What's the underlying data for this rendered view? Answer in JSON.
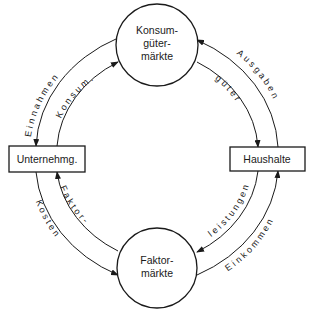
{
  "diagram": {
    "type": "circular-flow",
    "nodes": {
      "consumer_goods_market": {
        "lines": [
          "Konsum-",
          "güter-",
          "märkte"
        ]
      },
      "factor_market": {
        "lines": [
          "Faktor-",
          "märkte"
        ]
      },
      "firms": {
        "label": "Unternehmg."
      },
      "households": {
        "label": "Haushalte"
      }
    },
    "flows": {
      "revenue": {
        "label": "Einnahmen",
        "from": "Konsumgütermärkte",
        "to": "Unternehmg."
      },
      "consumer_goods_supply": {
        "label": "Konsum.",
        "from": "Unternehmg.",
        "to": "Konsumgütermärkte"
      },
      "expenditures": {
        "label": "Ausgaben",
        "from": "Haushalte",
        "to": "Konsumgütermärkte"
      },
      "goods": {
        "label": "güter",
        "from": "Konsumgütermärkte",
        "to": "Haushalte"
      },
      "factor_services": {
        "label": "leistungen",
        "from": "Haushalte",
        "to": "Faktormärkte"
      },
      "income": {
        "label": "Einkommen",
        "from": "Faktormärkte",
        "to": "Haushalte"
      },
      "factor": {
        "label": "Faktor-",
        "from": "Faktormärkte",
        "to": "Unternehmg."
      },
      "costs": {
        "label": "Kosten",
        "from": "Unternehmg.",
        "to": "Faktormärkte"
      }
    },
    "colors": {
      "stroke": "#1a1a1a",
      "background": "#ffffff"
    }
  }
}
